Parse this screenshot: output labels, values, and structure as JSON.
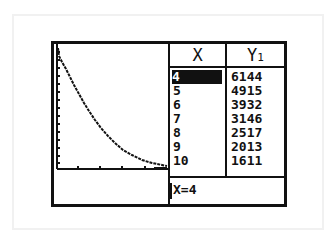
{
  "device": "graphing-calculator",
  "screen": {
    "mode": "graph-table split",
    "graph": {
      "function": "Y1",
      "shape": "exponential decay",
      "x_axis_ticks": 5,
      "y_axis_ticks": 15
    },
    "table": {
      "headers": {
        "x": "X",
        "y_main": "Y",
        "y_sub": "1"
      },
      "rows": [
        {
          "x": "4",
          "y": "6144",
          "selected": true
        },
        {
          "x": "5",
          "y": "4915"
        },
        {
          "x": "6",
          "y": "3932"
        },
        {
          "x": "7",
          "y": "3146"
        },
        {
          "x": "8",
          "y": "2517"
        },
        {
          "x": "9",
          "y": "2013"
        },
        {
          "x": "10",
          "y": "1611"
        }
      ]
    },
    "status_line": "X=4"
  },
  "colors": {
    "ink": "#111111",
    "background": "#ffffff"
  }
}
